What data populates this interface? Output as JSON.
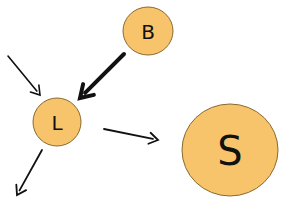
{
  "colors": {
    "node_fill": "#F7C46C",
    "node_stroke": "#8a6a30",
    "arrow": "#111111",
    "background": "#FFFFFF"
  },
  "nodes": [
    {
      "id": "B",
      "label": "B",
      "cx": 148,
      "cy": 31,
      "rx": 25,
      "ry": 24,
      "font_size": 20
    },
    {
      "id": "L",
      "label": "L",
      "cx": 57,
      "cy": 122,
      "rx": 24,
      "ry": 24,
      "font_size": 20
    },
    {
      "id": "S",
      "label": "S",
      "cx": 230,
      "cy": 150,
      "rx": 48,
      "ry": 46,
      "font_size": 40
    }
  ],
  "edges": [
    {
      "id": "incoming-to-L",
      "from": null,
      "to": "L",
      "x1": 8,
      "y1": 56,
      "x2": 40,
      "y2": 95,
      "width": 1.6
    },
    {
      "id": "B-to-L",
      "from": "B",
      "to": "L",
      "x1": 124,
      "y1": 54,
      "x2": 80,
      "y2": 98,
      "width": 4
    },
    {
      "id": "L-to-right",
      "from": "L",
      "to": null,
      "x1": 104,
      "y1": 129,
      "x2": 158,
      "y2": 140,
      "width": 1.8
    },
    {
      "id": "L-outgoing-down",
      "from": "L",
      "to": null,
      "x1": 42,
      "y1": 150,
      "x2": 17,
      "y2": 195,
      "width": 1.8
    }
  ]
}
